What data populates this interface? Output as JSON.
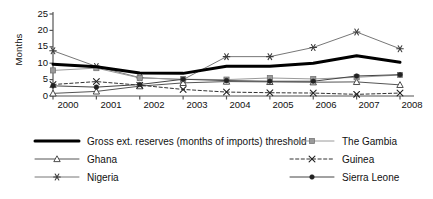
{
  "chart_data": {
    "type": "line",
    "title": "",
    "xlabel": "",
    "ylabel": "Months",
    "ylim": [
      0,
      25
    ],
    "yticks": [
      0,
      5,
      10,
      15,
      20,
      25
    ],
    "grid": false,
    "legend_position": "bottom",
    "categories": [
      "2000",
      "2001",
      "2002",
      "2003",
      "2004",
      "2005",
      "2006",
      "2007",
      "2008"
    ],
    "series": [
      {
        "name": "Gross ext. reserves (months of imports) threshold",
        "marker": "none",
        "line_style": "solid",
        "line_width": 3,
        "color": "#000000",
        "values": [
          9.7,
          8.9,
          7.0,
          6.9,
          9.1,
          9.1,
          10.0,
          12.3,
          10.3
        ]
      },
      {
        "name": "Ghana",
        "marker": "triangle-open",
        "line_style": "solid",
        "line_width": 1,
        "color": "#555555",
        "values": [
          0.8,
          1.4,
          3.0,
          4.0,
          4.4,
          4.3,
          4.2,
          4.3,
          3.4
        ]
      },
      {
        "name": "Nigeria",
        "marker": "asterisk",
        "line_style": "solid",
        "line_width": 1,
        "color": "#777777",
        "values": [
          13.8,
          9.0,
          5.6,
          5.0,
          12.0,
          12.0,
          14.8,
          19.5,
          14.4
        ]
      },
      {
        "name": "The Gambia",
        "marker": "square",
        "line_style": "solid",
        "line_width": 1,
        "color": "#9a9a9a",
        "values": [
          7.8,
          8.5,
          5.5,
          5.1,
          5.0,
          5.5,
          5.2,
          5.7,
          6.4
        ]
      },
      {
        "name": "Guinea",
        "marker": "x",
        "line_style": "dashed",
        "line_width": 1,
        "color": "#333333",
        "values": [
          3.5,
          4.4,
          3.3,
          2.0,
          1.2,
          1.0,
          0.9,
          0.5,
          0.9
        ]
      },
      {
        "name": "Sierra Leone",
        "marker": "circle-filled",
        "line_style": "solid",
        "line_width": 1,
        "color": "#444444",
        "values": [
          3.1,
          2.7,
          3.5,
          5.1,
          4.7,
          4.5,
          4.5,
          6.1,
          6.5
        ]
      }
    ]
  },
  "axis": {
    "y_label": "Months",
    "y_tick_labels": [
      "25",
      "20",
      "15",
      "10",
      "5",
      "0"
    ],
    "x_tick_labels": [
      "2000",
      "2001",
      "2002",
      "2003",
      "2004",
      "2005",
      "2006",
      "2007",
      "2008"
    ]
  },
  "legend": {
    "left_column": [
      {
        "label": "Gross ext. reserves (months of imports) threshold",
        "marker": "none"
      },
      {
        "label": "Ghana",
        "marker": "triangle-open"
      },
      {
        "label": "Nigeria",
        "marker": "asterisk"
      }
    ],
    "right_column": [
      {
        "label": "The Gambia",
        "marker": "square"
      },
      {
        "label": "Guinea",
        "marker": "x"
      },
      {
        "label": "Sierra Leone",
        "marker": "circle-filled"
      }
    ]
  }
}
